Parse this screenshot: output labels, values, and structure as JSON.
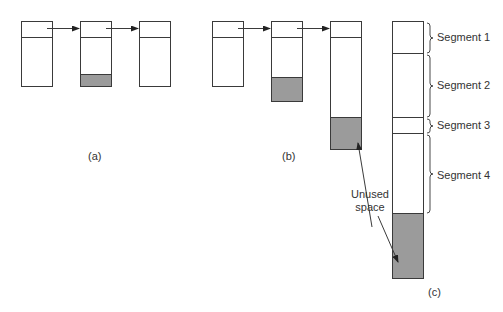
{
  "figure": {
    "parts": [
      {
        "id": "a",
        "label": "(a)"
      },
      {
        "id": "b",
        "label": "(b)"
      },
      {
        "id": "c",
        "label": "(c)"
      }
    ],
    "segments": [
      {
        "label": "Segment 1"
      },
      {
        "label": "Segment 2"
      },
      {
        "label": "Segment 3"
      },
      {
        "label": "Segment 4"
      }
    ],
    "annotation": {
      "line1": "Unused",
      "line2": "space"
    },
    "colors": {
      "unused_fill": "#9b9b9b",
      "stroke": "#3a3a3a"
    }
  }
}
